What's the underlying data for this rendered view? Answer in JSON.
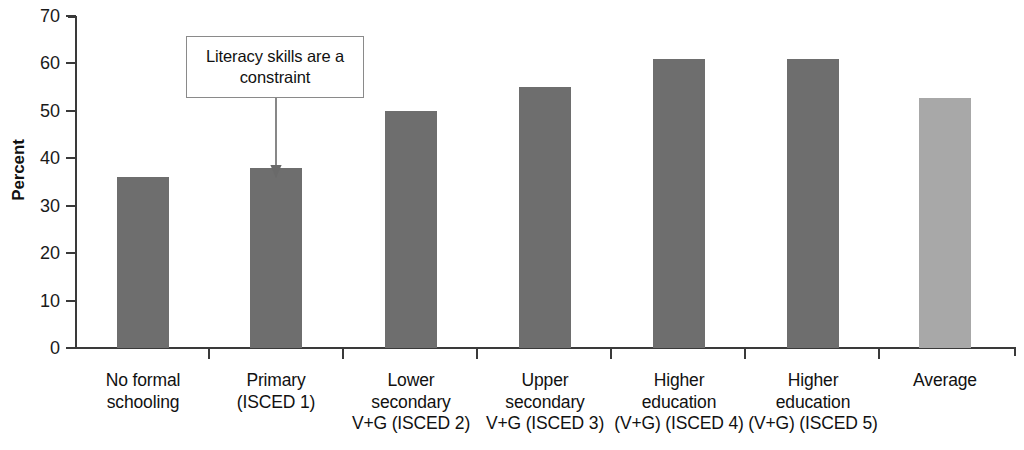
{
  "chart_data": {
    "type": "bar",
    "title": "",
    "subtitle": "",
    "xlabel": "",
    "ylabel": "Percent",
    "ylim": [
      0,
      70
    ],
    "yticks": [
      0,
      10,
      20,
      30,
      40,
      50,
      60,
      70
    ],
    "ytick_labels": [
      "0",
      "10",
      "20",
      "30",
      "40",
      "50",
      "60",
      "70"
    ],
    "grid": false,
    "legend": "none",
    "categories": [
      "No formal\nschooling",
      "Primary\n(ISCED 1)",
      "Lower\nsecondary\nV+G (ISCED 2)",
      "Upper\nsecondary\nV+G (ISCED 3)",
      "Higher\neducation\n(V+G) (ISCED 4)",
      "Higher\neducation\n(V+G) (ISCED 5)",
      "Average"
    ],
    "values": [
      36,
      38,
      50,
      55,
      61,
      61,
      52.8
    ],
    "bar_colors": [
      "#6e6e6e",
      "#6e6e6e",
      "#6e6e6e",
      "#6e6e6e",
      "#6e6e6e",
      "#6e6e6e",
      "#a8a8a8"
    ],
    "annotations": [
      {
        "text": "Literacy skills are a constraint",
        "points_to_category": "Primary\n(ISCED 1)",
        "points_to_value": 38
      }
    ]
  },
  "colors": {
    "bar_dark": "#6e6e6e",
    "bar_light": "#a8a8a8",
    "axis": "#3a3a3a",
    "text": "#111111",
    "callout_border": "#8a8a8a",
    "background": "#ffffff"
  }
}
